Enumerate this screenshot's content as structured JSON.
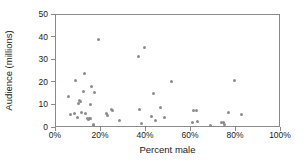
{
  "chart_data": {
    "type": "scatter",
    "title": "",
    "xlabel": "Percent male",
    "ylabel": "Audience (millions)",
    "xlim": [
      0,
      100
    ],
    "ylim": [
      0,
      50
    ],
    "xticks": [
      0,
      20,
      40,
      60,
      80,
      100
    ],
    "xtick_labels": [
      "0%",
      "20%",
      "40%",
      "60%",
      "80%",
      "100%"
    ],
    "yticks": [
      0,
      10,
      20,
      30,
      40,
      50
    ],
    "ytick_labels": [
      "0",
      "10",
      "20",
      "30",
      "40",
      "50"
    ],
    "grid": false,
    "legend": null,
    "marker_color": "#8c8c8c",
    "axis_color": "#8a8a8a",
    "points": [
      {
        "x": 5.5,
        "y": 14.0
      },
      {
        "x": 6.5,
        "y": 6.0
      },
      {
        "x": 8.0,
        "y": 6.2
      },
      {
        "x": 8.5,
        "y": 20.8
      },
      {
        "x": 9.5,
        "y": 4.5
      },
      {
        "x": 10.0,
        "y": 11.0
      },
      {
        "x": 10.5,
        "y": 12.3
      },
      {
        "x": 11.0,
        "y": 11.6
      },
      {
        "x": 11.5,
        "y": 6.8
      },
      {
        "x": 12.0,
        "y": 16.0
      },
      {
        "x": 12.5,
        "y": 24.2
      },
      {
        "x": 13.0,
        "y": 6.5
      },
      {
        "x": 14.0,
        "y": 4.3
      },
      {
        "x": 14.5,
        "y": 3.8
      },
      {
        "x": 15.0,
        "y": 4.0
      },
      {
        "x": 15.5,
        "y": 4.2
      },
      {
        "x": 15.5,
        "y": 10.6
      },
      {
        "x": 15.8,
        "y": 18.3
      },
      {
        "x": 16.5,
        "y": 1.5
      },
      {
        "x": 16.8,
        "y": 0.9
      },
      {
        "x": 17.0,
        "y": 15.5
      },
      {
        "x": 18.8,
        "y": 39.0
      },
      {
        "x": 22.5,
        "y": 6.6
      },
      {
        "x": 23.0,
        "y": 5.6
      },
      {
        "x": 24.5,
        "y": 8.2
      },
      {
        "x": 25.0,
        "y": 7.6
      },
      {
        "x": 28.0,
        "y": 3.3
      },
      {
        "x": 36.8,
        "y": 31.6
      },
      {
        "x": 37.2,
        "y": 8.2
      },
      {
        "x": 38.0,
        "y": 1.9
      },
      {
        "x": 39.5,
        "y": 35.8
      },
      {
        "x": 42.5,
        "y": 5.2
      },
      {
        "x": 43.5,
        "y": 15.1
      },
      {
        "x": 44.0,
        "y": 3.3
      },
      {
        "x": 46.5,
        "y": 8.9
      },
      {
        "x": 48.0,
        "y": 4.7
      },
      {
        "x": 51.5,
        "y": 20.6
      },
      {
        "x": 60.5,
        "y": 2.5
      },
      {
        "x": 61.0,
        "y": 7.6
      },
      {
        "x": 62.5,
        "y": 7.9
      },
      {
        "x": 62.8,
        "y": 3.0
      },
      {
        "x": 68.5,
        "y": 1.3
      },
      {
        "x": 73.5,
        "y": 2.3
      },
      {
        "x": 74.5,
        "y": 2.4
      },
      {
        "x": 75.0,
        "y": 1.6
      },
      {
        "x": 76.5,
        "y": 6.8
      },
      {
        "x": 79.5,
        "y": 21.2
      },
      {
        "x": 82.5,
        "y": 6.1
      }
    ]
  }
}
